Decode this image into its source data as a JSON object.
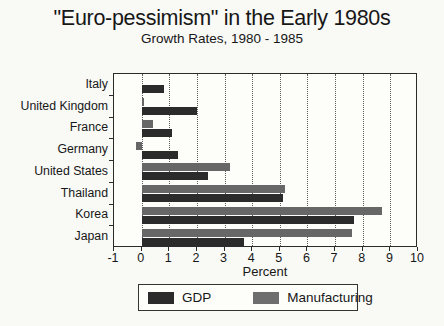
{
  "title": "\"Euro-pessimism\" in the Early 1980s",
  "subtitle": "Growth Rates, 1980 - 1985",
  "axis": {
    "xlabel": "Percent"
  },
  "legend": {
    "items": [
      {
        "label": "GDP",
        "color": "#2b2b2b"
      },
      {
        "label": "Manufacturing",
        "color": "#6e6e6e"
      }
    ]
  },
  "chart_data": {
    "type": "bar",
    "orientation": "horizontal",
    "title": "\"Euro-pessimism\" in the Early 1980s",
    "subtitle": "Growth Rates, 1980 - 1985",
    "categories": [
      "Italy",
      "United Kingdom",
      "France",
      "Germany",
      "United States",
      "Thailand",
      "Korea",
      "Japan"
    ],
    "series": [
      {
        "name": "GDP",
        "color": "#2b2b2b",
        "values": [
          0.8,
          2.0,
          1.1,
          1.3,
          2.4,
          5.1,
          7.7,
          3.7
        ]
      },
      {
        "name": "Manufacturing",
        "color": "#676767",
        "values": [
          0,
          0.1,
          0.4,
          -0.2,
          3.2,
          5.2,
          8.7,
          7.6
        ]
      }
    ],
    "xlabel": "Percent",
    "xlim": [
      -1,
      10
    ],
    "xticks": [
      -1,
      0,
      1,
      2,
      3,
      4,
      5,
      6,
      7,
      8,
      9,
      10
    ],
    "grid": true,
    "legend_position": "bottom",
    "bar_order_note": "Manufacturing bar drawn above GDP bar in each category row"
  }
}
